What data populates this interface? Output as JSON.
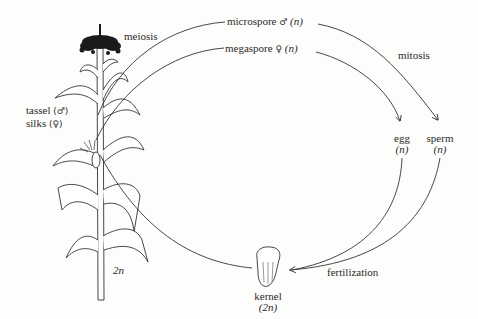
{
  "diagram": {
    "nodes": {
      "meiosis": "meiosis",
      "microspore": {
        "label": "microspore",
        "symbol": "♂",
        "ploidy": "(n)"
      },
      "megaspore": {
        "label": "megaspore",
        "symbol": "♀",
        "ploidy": "(n)"
      },
      "mitosis": "mitosis",
      "egg": {
        "label": "egg",
        "ploidy": "(n)"
      },
      "sperm": {
        "label": "sperm",
        "ploidy": "(n)"
      },
      "fertilization": "fertilization",
      "kernel": {
        "label": "kernel",
        "ploidy": "(2n)"
      },
      "tassel": {
        "label": "tassel",
        "symbol": "(♂)"
      },
      "silks": {
        "label": "silks",
        "symbol": "(♀)"
      },
      "plant_ploidy": "2n"
    },
    "edges": [
      {
        "from": "tassel",
        "to": "microspore",
        "process": "meiosis"
      },
      {
        "from": "silks",
        "to": "megaspore",
        "process": "meiosis"
      },
      {
        "from": "microspore",
        "to": "sperm",
        "process": "mitosis"
      },
      {
        "from": "megaspore",
        "to": "egg",
        "process": "mitosis"
      },
      {
        "from": "egg",
        "to": "kernel",
        "process": "fertilization"
      },
      {
        "from": "sperm",
        "to": "kernel",
        "process": "fertilization"
      },
      {
        "from": "kernel",
        "to": "plant"
      }
    ],
    "colors": {
      "line": "#333333",
      "text": "#2a2a2a",
      "background": "#fdfdfb"
    }
  }
}
